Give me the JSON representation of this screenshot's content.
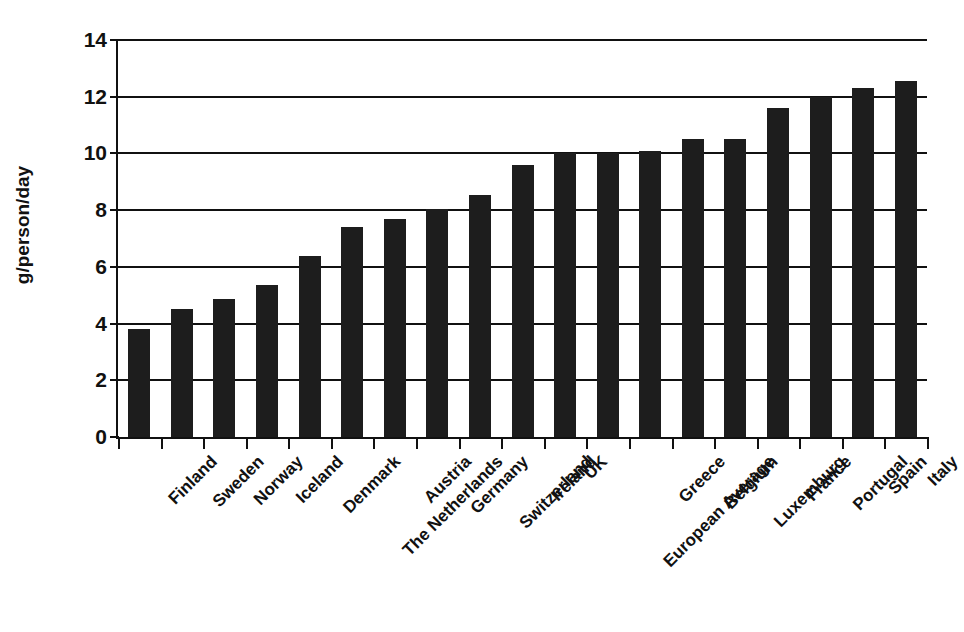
{
  "chart_data": {
    "type": "bar",
    "title": "",
    "subtitle": "",
    "xlabel": "",
    "ylabel": "g/person/day",
    "ylim": [
      0,
      14
    ],
    "ytick_step": 2,
    "yticks": [
      0,
      2,
      4,
      6,
      8,
      10,
      12,
      14
    ],
    "ytick_labels": [
      "0",
      "2",
      "4",
      "6",
      "8",
      "10",
      "12",
      "14"
    ],
    "grid": "horizontal",
    "legend": "none",
    "bar_color": "#1d1d1d",
    "axis_color": "#111111",
    "background": "#ffffff",
    "label_rotation_deg": -45,
    "categories": [
      "Finland",
      "Sweden",
      "Norway",
      "Iceland",
      "Denmark",
      "The Netherlands",
      "Austria",
      "Germany",
      "Switzerland",
      "Ireland",
      "UK",
      "European Average",
      "Greece",
      "Belgium",
      "Luxemburg",
      "France",
      "Portugal",
      "Spain",
      "Italy"
    ],
    "values": [
      3.8,
      4.5,
      4.85,
      5.35,
      6.4,
      7.4,
      7.7,
      8.05,
      8.55,
      9.6,
      10.0,
      10.0,
      10.1,
      10.5,
      10.5,
      11.6,
      12.0,
      12.3,
      12.55
    ]
  }
}
